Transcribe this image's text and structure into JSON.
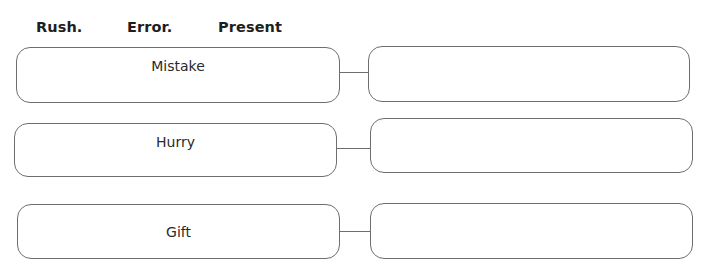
{
  "word_bank": {
    "words": [
      "Rush.",
      "Error.",
      "Present"
    ]
  },
  "matching_rows": [
    {
      "given_word": "Mistake",
      "answer": ""
    },
    {
      "given_word": "Hurry",
      "answer": ""
    },
    {
      "given_word": "Gift",
      "answer": ""
    }
  ],
  "colors": {
    "border": "#6e6e6e",
    "text": "#222222",
    "background": "#ffffff"
  }
}
